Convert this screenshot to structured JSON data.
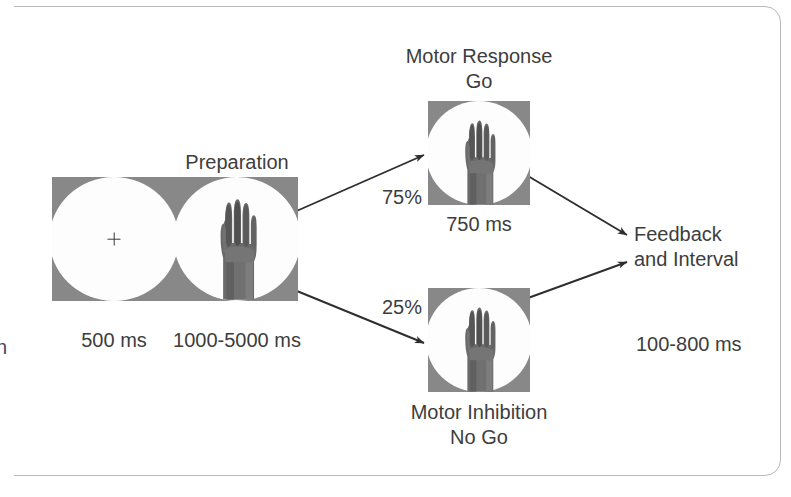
{
  "figure": {
    "kind": "experimental-paradigm-flow-diagram",
    "title_visible": false,
    "colors": {
      "stimulus_background": "#888888",
      "stimulus_disc": "#fdfdfd",
      "text": "#3d3d3d",
      "arrow": "#2e2e2e",
      "page_border": "#b9b9b9",
      "hand_dark": "#5d5d5d",
      "hand_mid": "#7b7b7b",
      "hand_light": "#9a9a9a"
    }
  },
  "stimuli": {
    "fixation": {
      "name": "fixation-cross-stimulus",
      "icon": "plus-cross-icon",
      "duration_label": "500 ms"
    },
    "preparation": {
      "name": "preparation-hand-stimulus",
      "title_label": "Preparation",
      "icon": "hand-open-palm-image",
      "duration_label": "1000-5000 ms"
    },
    "go": {
      "name": "go-hand-stimulus",
      "title_line1": "Motor Response",
      "title_line2": "Go",
      "icon": "hand-open-palm-image",
      "duration_label": "750 ms",
      "probability_label": "75%"
    },
    "nogo": {
      "name": "nogo-hand-stimulus",
      "title_line1": "Motor Inhibition",
      "title_line2": "No Go",
      "icon": "hand-open-palm-image",
      "probability_label": "25%"
    },
    "feedback": {
      "name": "feedback-and-interval",
      "title_line1": "Feedback",
      "title_line2": "and Interval",
      "duration_label": "100-800 ms"
    }
  },
  "clipped_text": {
    "left_edge_fragment": "n"
  }
}
